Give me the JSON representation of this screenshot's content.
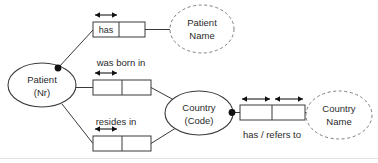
{
  "diagram": {
    "kind": "orm-conceptual-schema",
    "width": 378,
    "height": 163,
    "colors": {
      "line": "#3a3a3a",
      "dashed": "#7d7d7d",
      "text": "#2b2b2b",
      "marker": "#111111",
      "background": "#ffffff"
    }
  },
  "entities": [
    {
      "id": "patient",
      "line1": "Patient",
      "line2": "(Nr)",
      "cx": 42,
      "cy": 85,
      "rx": 34,
      "ry": 22
    },
    {
      "id": "country",
      "line1": "Country",
      "line2": "(Code)",
      "cx": 199,
      "cy": 113,
      "rx": 34,
      "ry": 22
    }
  ],
  "values": [
    {
      "id": "patient-name",
      "line1": "Patient",
      "line2": "Name",
      "cx": 202,
      "cy": 29,
      "rx": 32,
      "ry": 24
    },
    {
      "id": "country-name",
      "line1": "Country",
      "line2": "Name",
      "cx": 339,
      "cy": 115,
      "rx": 33,
      "ry": 24
    }
  ],
  "facts": [
    {
      "id": "has-patient-name",
      "predicate": "has",
      "predicate_inside": true,
      "predicate_label": "",
      "roles": 2,
      "x": 93,
      "y": 22,
      "w": 52,
      "h": 15,
      "uniqueness_span": [
        0,
        1
      ],
      "uniqueness_y": 15
    },
    {
      "id": "was-born-in",
      "predicate": "",
      "predicate_inside": false,
      "predicate_label": "was born in",
      "label_x": 121,
      "label_y": 63,
      "roles": 2,
      "x": 93,
      "y": 80,
      "w": 58,
      "h": 15,
      "uniqueness_span": [
        0,
        1
      ],
      "uniqueness_y": 73
    },
    {
      "id": "resides-in",
      "predicate": "",
      "predicate_inside": false,
      "predicate_label": "resides in",
      "label_x": 116,
      "label_y": 122,
      "roles": 2,
      "x": 93,
      "y": 136,
      "w": 58,
      "h": 15,
      "uniqueness_span": [
        0,
        1
      ],
      "uniqueness_y": 129
    },
    {
      "id": "has-refers-to",
      "predicate": "",
      "predicate_inside": false,
      "predicate_label": "has / refers to",
      "label_x": 272,
      "label_y": 135,
      "roles": 2,
      "x": 240,
      "y": 105,
      "w": 65,
      "h": 15,
      "uniqueness_y": 99
    }
  ],
  "mandatory_dots": [
    {
      "id": "patient-mandatory",
      "cx": 58,
      "cy": 68
    },
    {
      "id": "country-mandatory",
      "cx": 232,
      "cy": 113
    }
  ],
  "labels": {
    "has": "has",
    "was_born_in": "was born in",
    "resides_in": "resides in",
    "has_refers_to": "has / refers to",
    "patient": "Patient",
    "patient_key": "(Nr)",
    "country": "Country",
    "country_key": "(Code)",
    "patient_name_l1": "Patient",
    "patient_name_l2": "Name",
    "country_name_l1": "Country",
    "country_name_l2": "Name"
  }
}
